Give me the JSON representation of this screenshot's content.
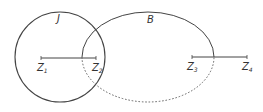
{
  "diagram": {
    "shapes": [
      {
        "id": "J",
        "type": "circle",
        "label": "J"
      },
      {
        "id": "B",
        "type": "ellipse",
        "label": "B",
        "upper_style": "solid",
        "lower_style": "dashed"
      }
    ],
    "segments": [
      {
        "from": {
          "base": "Z",
          "sub": "1"
        },
        "to": {
          "base": "Z",
          "sub": "2"
        }
      },
      {
        "from": {
          "base": "Z",
          "sub": "3"
        },
        "to": {
          "base": "Z",
          "sub": "4"
        }
      }
    ],
    "colors": {
      "stroke": "#444444",
      "background": "#ffffff"
    }
  }
}
